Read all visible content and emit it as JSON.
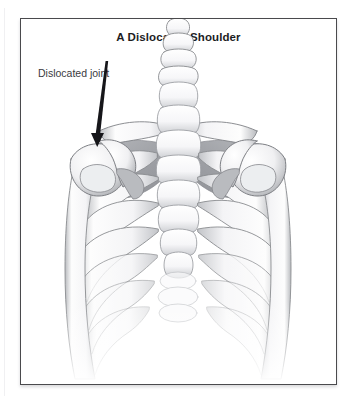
{
  "figure": {
    "title": "A Dislocated Shoulder",
    "top_artifact_text": "",
    "border_color": "#4a4a4d",
    "background_color": "#ffffff"
  },
  "annotations": [
    {
      "id": "dislocated-joint",
      "label": "Dislocated joint",
      "text_color": "#3a3a3e",
      "leader": {
        "type": "tapered-arrow",
        "from": [
          88,
          60
        ],
        "to": [
          77,
          143
        ],
        "color": "#16161a"
      },
      "points_at": "left-shoulder-joint"
    }
  ],
  "illustration": {
    "subject": "human thorax skeleton, anterior view",
    "style": "grayscale medical line drawing with soft shading",
    "colors": {
      "bone_fill": "#fdfdfd",
      "bone_outline": "#8e9094",
      "bone_outline_dark": "#6f7175",
      "shadow_mid": "#a9abaf",
      "shadow_deep": "#8c8e93",
      "scapula_shade": "#a2a4a8",
      "fade_tint": "#d8dade"
    },
    "parts": [
      {
        "name": "cervical-vertebrae",
        "count": 4,
        "region": "top-center"
      },
      {
        "name": "thoracic-vertebrae",
        "count": 9,
        "region": "center-column"
      },
      {
        "name": "lumbar-vertebrae",
        "count": 3,
        "region": "bottom-center"
      },
      {
        "name": "clavicle-left",
        "region": "upper-left"
      },
      {
        "name": "clavicle-right",
        "region": "upper-right"
      },
      {
        "name": "scapula-left",
        "region": "upper-left",
        "shaded": true
      },
      {
        "name": "scapula-right",
        "region": "upper-right",
        "shaded": true
      },
      {
        "name": "humerus-left",
        "region": "left-side",
        "state": "dislocated"
      },
      {
        "name": "humerus-right",
        "region": "right-side",
        "state": "normal"
      },
      {
        "name": "ribs-left",
        "count": 10,
        "region": "left-thorax"
      },
      {
        "name": "ribs-right",
        "count": 10,
        "region": "right-thorax"
      },
      {
        "name": "sternum",
        "region": "center"
      }
    ]
  }
}
